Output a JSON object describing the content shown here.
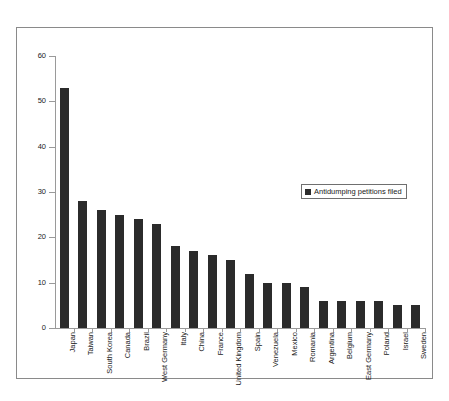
{
  "chart_data": {
    "type": "bar",
    "title": "",
    "subtitle": "",
    "xlabel": "",
    "ylabel": "",
    "ylim": [
      0,
      60
    ],
    "yticks": [
      0,
      10,
      20,
      30,
      40,
      50,
      60
    ],
    "grid": false,
    "legend_position": "center-right",
    "series_name": "Antidumping petitions filed",
    "bar_color": "#2b2b2b",
    "categories": [
      "Japan",
      "Taiwan",
      "South Korea",
      "Canada",
      "Brazil",
      "West Germany",
      "Italy",
      "China",
      "France",
      "United Kingdom",
      "Spain",
      "Venezuela",
      "Mexico",
      "Romania",
      "Argentina",
      "Belgium",
      "East Germany",
      "Poland",
      "Israel",
      "Sweden"
    ],
    "values": [
      53,
      28,
      26,
      25,
      24,
      23,
      18,
      17,
      16,
      15,
      12,
      10,
      10,
      9,
      6,
      6,
      6,
      6,
      5,
      5
    ],
    "series": [
      {
        "name": "Antidumping petitions filed",
        "values": [
          53,
          28,
          26,
          25,
          24,
          23,
          18,
          17,
          16,
          15,
          12,
          10,
          10,
          9,
          6,
          6,
          6,
          6,
          5,
          5
        ]
      }
    ]
  },
  "legend": {
    "label": "Antidumping petitions filed"
  }
}
